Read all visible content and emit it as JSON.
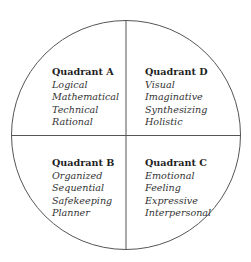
{
  "diagram": {
    "type": "four-quadrant-circle",
    "line_color": "#555555",
    "quadrants": [
      {
        "id": "A",
        "position": "top-left",
        "title": "Quadrant A",
        "items": [
          "Logical",
          "Mathematical",
          "Technical",
          "Rational"
        ]
      },
      {
        "id": "D",
        "position": "top-right",
        "title": "Quadrant D",
        "items": [
          "Visual",
          "Imaginative",
          "Synthesizing",
          "Holistic"
        ]
      },
      {
        "id": "B",
        "position": "bottom-left",
        "title": "Quadrant B",
        "items": [
          "Organized",
          "Sequential",
          "Safekeeping",
          "Planner"
        ]
      },
      {
        "id": "C",
        "position": "bottom-right",
        "title": "Quadrant C",
        "items": [
          "Emotional",
          "Feeling",
          "Expressive",
          "Interpersonal"
        ]
      }
    ]
  }
}
